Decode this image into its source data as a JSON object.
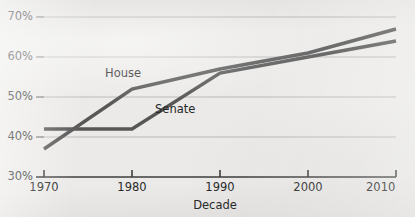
{
  "chart_data": {
    "type": "line",
    "title": "",
    "subtitle": "",
    "xlabel": "Decade",
    "ylabel": "",
    "x": [
      1970,
      1980,
      1990,
      2000,
      2010
    ],
    "xtick_labels": [
      "1970",
      "1980",
      "1990",
      "2000",
      "2010"
    ],
    "ytick_labels": [
      "30%",
      "40%",
      "50%",
      "60%",
      "70%"
    ],
    "ytick_values": [
      30,
      40,
      50,
      60,
      70
    ],
    "xlim": [
      1970,
      2010
    ],
    "ylim": [
      30,
      70
    ],
    "grid": true,
    "grid_axis": "y",
    "legend": "inline-labels",
    "legend_position": "inline",
    "series": [
      {
        "name": "House",
        "color": "#575757",
        "values": [
          37,
          52,
          57,
          61,
          67
        ],
        "label_text": "House"
      },
      {
        "name": "Senate",
        "color": "#575757",
        "values": [
          42,
          42,
          56,
          60,
          64
        ],
        "label_text": "Senate"
      }
    ],
    "annotations": [
      {
        "text": "House",
        "x": 1981,
        "y": 54
      },
      {
        "text": "Senate",
        "x": 1989,
        "y": 48
      }
    ]
  },
  "axes": {
    "y_ticks": [
      {
        "label": "70%",
        "value": 70
      },
      {
        "label": "60%",
        "value": 60
      },
      {
        "label": "50%",
        "value": 50
      },
      {
        "label": "40%",
        "value": 40
      },
      {
        "label": "30%",
        "value": 30
      }
    ],
    "x_ticks": [
      {
        "label": "1970",
        "value": 1970
      },
      {
        "label": "1980",
        "value": 1980
      },
      {
        "label": "1990",
        "value": 1990
      },
      {
        "label": "2000",
        "value": 2000
      },
      {
        "label": "2010",
        "value": 2010
      }
    ],
    "x_title": "Decade"
  },
  "style": {
    "background": "#ebeae8",
    "line_color": "#575757",
    "grid_color": "#b9b8b6",
    "axis_color": "#3d3d3d",
    "text_color": "#2a2a2a"
  }
}
